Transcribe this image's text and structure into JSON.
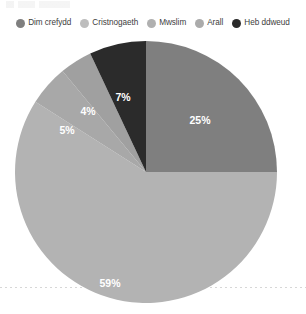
{
  "chart_data": {
    "type": "pie",
    "title": "",
    "xlabel": "",
    "ylabel": "",
    "categories": [
      "Dim crefydd",
      "Cristnogaeth",
      "Mwslim",
      "Arall",
      "Heb ddweud"
    ],
    "values": [
      25,
      59,
      5,
      4,
      7
    ],
    "value_labels": [
      "25%",
      "59%",
      "5%",
      "4%",
      "7%"
    ],
    "colors": [
      "#7f7f7f",
      "#b3b3b3",
      "#a8a8a8",
      "#a0a0a0",
      "#2b2b2b"
    ],
    "legend_position": "top",
    "grid": false,
    "start_angle_deg": 0,
    "direction": "clockwise",
    "units": "percent"
  },
  "legend": {
    "items": [
      {
        "label": "Dim crefydd",
        "color": "#7f7f7f"
      },
      {
        "label": "Cristnogaeth",
        "color": "#b3b3b3"
      },
      {
        "label": "Mwslim",
        "color": "#a8a8a8"
      },
      {
        "label": "Arall",
        "color": "#a0a0a0"
      },
      {
        "label": "Heb ddweud",
        "color": "#2b2b2b"
      }
    ]
  },
  "slice_labels": [
    {
      "text": "25%",
      "x": 200,
      "y": 90
    },
    {
      "text": "59%",
      "x": 110,
      "y": 253
    },
    {
      "text": "5%",
      "x": 67,
      "y": 100
    },
    {
      "text": "4%",
      "x": 88,
      "y": 81
    },
    {
      "text": "7%",
      "x": 123,
      "y": 67
    }
  ]
}
